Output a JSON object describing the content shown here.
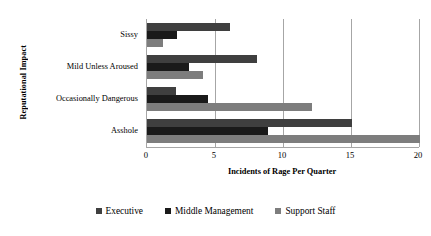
{
  "chart_data": {
    "type": "bar",
    "orientation": "horizontal",
    "title": "",
    "xlabel": "Incidents of Rage Per Quarter",
    "ylabel": "Reputational Impact",
    "categories": [
      "Sissy",
      "Mild Unless Aroused",
      "Occasionally Dangerous",
      "Asshole"
    ],
    "series": [
      {
        "name": "Executive",
        "color": "#3f3f3f",
        "values": [
          6.1,
          8.1,
          2.1,
          15.1
        ]
      },
      {
        "name": "Middle Management",
        "color": "#1a1a1a",
        "values": [
          2.2,
          3.1,
          4.5,
          8.9
        ]
      },
      {
        "name": "Support Staff",
        "color": "#7d7d7d",
        "values": [
          1.2,
          4.1,
          12.1,
          20.1
        ]
      }
    ],
    "xlim": [
      0,
      20
    ],
    "xticks": [
      0,
      5,
      10,
      15,
      20
    ],
    "xtick_labels": [
      "0",
      "5",
      "10",
      "15",
      "20"
    ],
    "grid": "vertical",
    "legend_position": "bottom",
    "axis_color": "#a6a6a6",
    "background": "#ffffff"
  }
}
